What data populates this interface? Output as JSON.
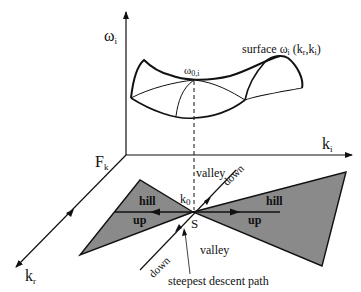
{
  "axes": {
    "vertical": {
      "symbol": "ω",
      "subscript": "i"
    },
    "horizontal": {
      "symbol": "k",
      "subscript": "i"
    },
    "depth": {
      "symbol": "k",
      "subscript": "r"
    },
    "origin_label": {
      "symbol": "F",
      "subscript": "k"
    }
  },
  "surface": {
    "label": "surface ω",
    "label_sub": "i",
    "label_args": " (k",
    "label_args_r": "r",
    "label_args_mid": ",k",
    "label_args_i": "i",
    "label_args_end": ")",
    "saddle_symbol": "ω",
    "saddle_sub": "0,i"
  },
  "plane": {
    "k0_symbol": "k",
    "k0_sub": "0",
    "saddle_point": "S",
    "regions": {
      "hill_left": "hill",
      "hill_right": "hill",
      "up_left": "up",
      "up_right": "up",
      "valley_top": "valley",
      "valley_bottom": "valley",
      "down_top": "down",
      "down_bottom": "down"
    },
    "path_label": "steepest descent path"
  },
  "colors": {
    "ink": "#111111",
    "hill_fill": "#8a8a8a"
  }
}
